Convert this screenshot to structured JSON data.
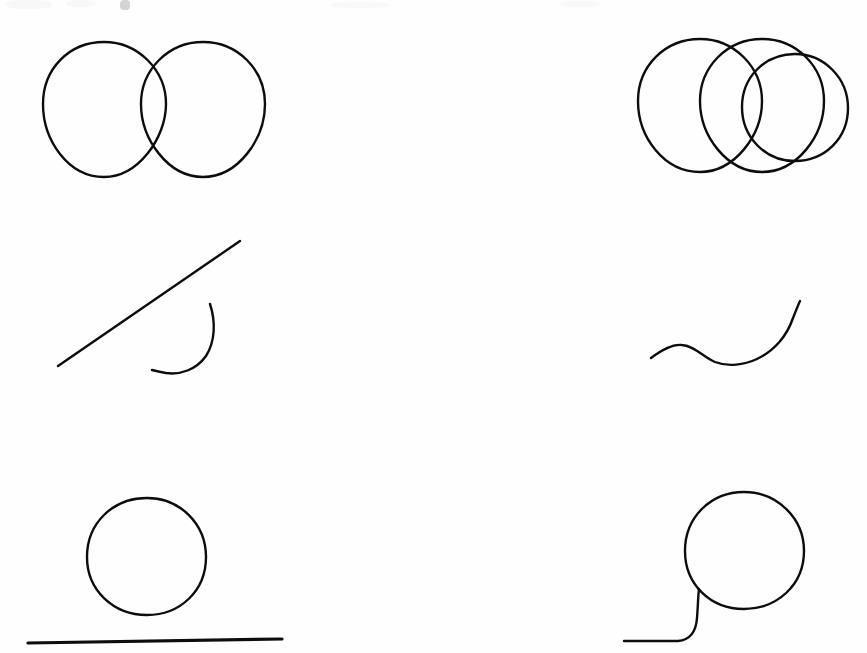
{
  "page": {
    "width": 867,
    "height": 653,
    "background_color": "#fefefe",
    "ink_color": "#0d0d0d"
  },
  "figures": [
    {
      "id": "fig-top-left",
      "name": "two-overlapping-circles",
      "label": "Two overlapping circles",
      "row": 1,
      "column": "left",
      "stroke_width": 2.4,
      "shapes": [
        {
          "kind": "circle",
          "cx": 104,
          "cy": 104,
          "r": 62
        },
        {
          "kind": "circle",
          "cx": 203,
          "cy": 104,
          "r": 62
        }
      ]
    },
    {
      "id": "fig-top-right",
      "name": "three-overlapping-circles",
      "label": "Three overlapping circles",
      "row": 1,
      "column": "right",
      "stroke_width": 2.4,
      "shapes": [
        {
          "kind": "circle",
          "cx": 700,
          "cy": 101,
          "r": 62
        },
        {
          "kind": "circle",
          "cx": 762,
          "cy": 101,
          "r": 62
        },
        {
          "kind": "circle",
          "cx": 795,
          "cy": 107,
          "r": 53
        }
      ]
    },
    {
      "id": "fig-mid-left",
      "name": "diagonal-line-and-arc",
      "label": "Diagonal straight line with separate open arc",
      "row": 2,
      "column": "left",
      "stroke_width": 2.4,
      "shapes": [
        {
          "kind": "line",
          "x1": 58,
          "y1": 366,
          "x2": 240,
          "y2": 241
        },
        {
          "kind": "arc",
          "cx": 178,
          "cy": 338,
          "r": 35,
          "start_deg": -62,
          "end_deg": 128
        }
      ]
    },
    {
      "id": "fig-mid-right",
      "name": "s-shaped-wavy-curve",
      "label": "S-shaped wavy curve",
      "row": 2,
      "column": "right",
      "stroke_width": 2.4,
      "shapes": [
        {
          "kind": "wave",
          "start": [
            651,
            358
          ],
          "end": [
            800,
            301
          ]
        }
      ]
    },
    {
      "id": "fig-bottom-left",
      "name": "circle-above-horizontal-line",
      "label": "Circle above a horizontal straight line",
      "row": 3,
      "column": "left",
      "stroke_width": 2.4,
      "shapes": [
        {
          "kind": "circle",
          "cx": 147,
          "cy": 557,
          "r": 59
        },
        {
          "kind": "line",
          "x1": 28,
          "y1": 643,
          "x2": 282,
          "y2": 639,
          "stroke_width": 3.2
        }
      ]
    },
    {
      "id": "fig-bottom-right",
      "name": "circle-with-curved-tail",
      "label": "Circle with a curved tail trailing to a horizontal line",
      "row": 3,
      "column": "right",
      "stroke_width": 2.4,
      "shapes": [
        {
          "kind": "circle",
          "cx": 744,
          "cy": 551,
          "r": 59
        },
        {
          "kind": "tail",
          "start": [
            624,
            641
          ],
          "end": [
            699,
            589
          ]
        }
      ]
    }
  ],
  "artifacts": {
    "top_edge_smudge_label": "faint cut-off pen marks at top edge"
  }
}
